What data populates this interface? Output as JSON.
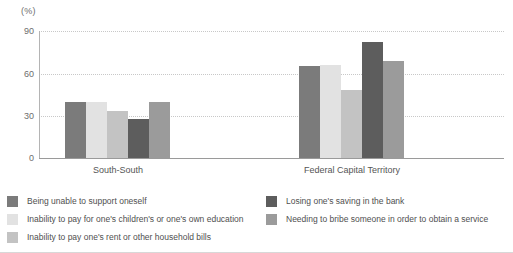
{
  "chart_data": {
    "type": "bar",
    "title": "",
    "subtitle": "",
    "xlabel": "",
    "ylabel": "(%)",
    "unit_label": "(%)",
    "categories": [
      "South-South",
      "Federal Capital Territory"
    ],
    "series": [
      {
        "name": "Being unable to support oneself",
        "color": "#7b7b7b",
        "values": [
          40,
          65
        ]
      },
      {
        "name": "Inability to pay for one's children's or one's own education",
        "color": "#e2e2e2",
        "values": [
          40,
          66
        ]
      },
      {
        "name": "Inability to pay one's rent or other household bills",
        "color": "#c3c3c3",
        "values": [
          33,
          48
        ]
      },
      {
        "name": "Losing one's saving in the bank",
        "color": "#5d5d5d",
        "values": [
          28,
          82
        ]
      },
      {
        "name": "Needing to bribe someone in order to obtain a service",
        "color": "#9b9b9b",
        "values": [
          40,
          69
        ]
      }
    ],
    "yticks": [
      0,
      30,
      60,
      90
    ],
    "ytick_labels": [
      "0",
      "30",
      "60",
      "90"
    ],
    "ylim": [
      0,
      90
    ],
    "grid": true,
    "grid_style": "dotted",
    "grid_color": "#c8c8c8",
    "legend_position": "bottom",
    "legend_columns": 2,
    "legend_left": [
      "Being unable to support oneself",
      "Inability to pay for one's children's or one's own education",
      "Inability to pay one's rent or other household bills"
    ],
    "legend_right": [
      "Losing one's saving in the bank",
      "Needing to bribe someone in order to obtain a service"
    ]
  },
  "axis": {
    "unit": "(%)",
    "tick_0": "0",
    "tick_30": "30",
    "tick_60": "60",
    "tick_90": "90"
  },
  "groups": {
    "g0_label": "South-South",
    "g1_label": "Federal Capital Territory"
  },
  "legend": {
    "item0": "Being unable to support oneself",
    "item1": "Inability to pay for one's children's or one's own education",
    "item2": "Inability to pay one's rent or other household bills",
    "item3": "Losing one's saving in the bank",
    "item4": "Needing to bribe someone in order to obtain a service"
  },
  "colors": {
    "series0": "#7b7b7b",
    "series1": "#e2e2e2",
    "series2": "#c3c3c3",
    "series3": "#5d5d5d",
    "series4": "#9b9b9b",
    "grid": "#c8c8c8",
    "axis": "#9a9a9a",
    "text": "#4f4f4f"
  }
}
